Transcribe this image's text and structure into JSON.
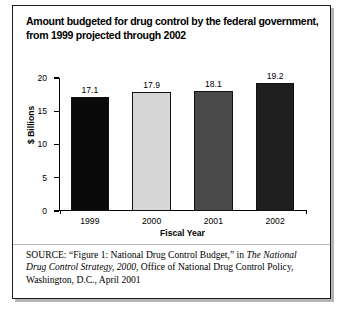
{
  "figure": {
    "title_line1": "Amount budgeted for drug control by the federal government,",
    "title_line2": "from 1999 projected through 2002",
    "source_label": "SOURCE:",
    "source_part1": "“Figure 1: National Drug Control Budget,” in ",
    "source_italic1": "The National Drug Control Strategy, 2000",
    "source_part2": ", Office of National Drug Control Policy, Washington, D.C., April 2001"
  },
  "chart_data": {
    "type": "bar",
    "title": "Amount budgeted for drug control by the federal government, from 1999 projected through 2002",
    "xlabel": "Fiscal Year",
    "ylabel": "$ Billions",
    "categories": [
      "1999",
      "2000",
      "2001",
      "2002"
    ],
    "values": [
      17.1,
      17.9,
      18.1,
      19.2
    ],
    "value_labels": [
      "17.1",
      "17.9",
      "18.1",
      "19.2"
    ],
    "ylim": [
      0,
      20
    ],
    "yticks": [
      0,
      5,
      10,
      15,
      20
    ],
    "ytick_labels": [
      "0",
      "5",
      "10",
      "15",
      "20"
    ],
    "grid": false,
    "legend": "none",
    "bar_colors": [
      "#0a0a0a",
      "#d6d6d6",
      "#4a4a4a",
      "#1f1f1f"
    ]
  }
}
